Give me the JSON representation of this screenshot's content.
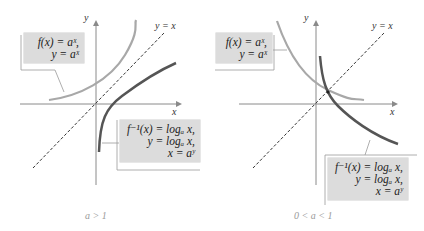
{
  "figure": {
    "panels": [
      {
        "id": "a-greater-than-1",
        "caption": "a > 1",
        "axis_x_label": "x",
        "axis_y_label": "y",
        "line_label": "y = x",
        "exp_box": {
          "line1": "f(x) = aˣ,",
          "line2": "y = aˣ"
        },
        "log_box": {
          "line1": "f⁻¹(x) = logₐ x,",
          "line2": "y = logₐ x,",
          "line3": "x = aʸ"
        }
      },
      {
        "id": "a-between-0-and-1",
        "caption": "0 < a < 1",
        "axis_x_label": "x",
        "axis_y_label": "y",
        "line_label": "y = x",
        "exp_box": {
          "line1": "f(x) = aˣ,",
          "line2": "y = aˣ"
        },
        "log_box": {
          "line1": "f⁻¹(x) = logₐ x,",
          "line2": "y = logₐ x,",
          "line3": "x = aʸ"
        }
      }
    ],
    "colors": {
      "exp_curve": "#a8a8a8",
      "log_curve": "#555555",
      "axes": "#888888",
      "dashed_line": "#333333",
      "box_fill": "#dcdcdc",
      "caption": "#9a9a9a"
    }
  }
}
